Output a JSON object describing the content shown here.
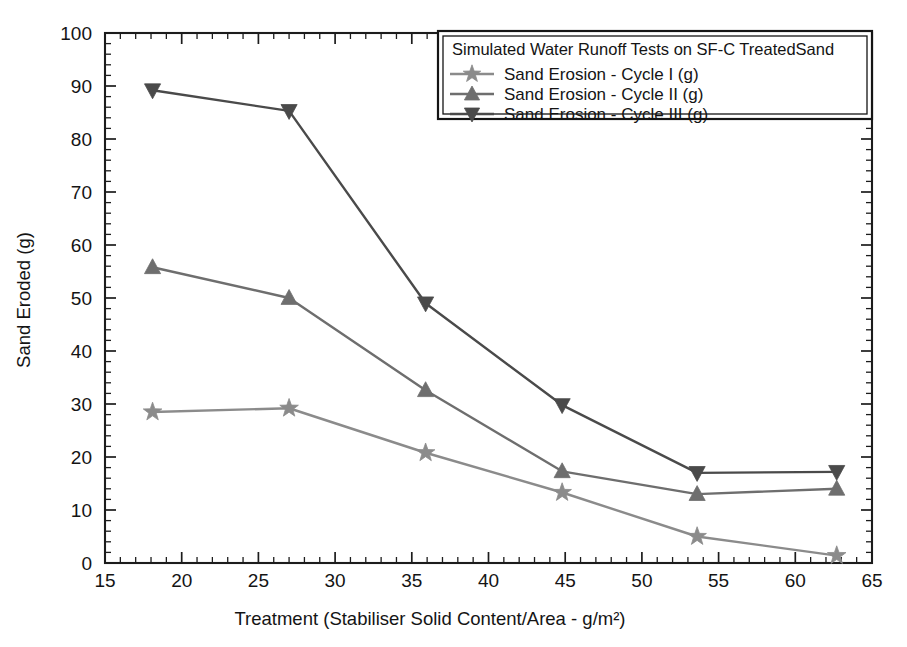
{
  "chart_data": {
    "type": "line",
    "title": "",
    "legend_title": "Simulated Water Runoff Tests on SF-C TreatedSand",
    "legend_position": "top-right",
    "grid": false,
    "xlabel": "Treatment (Stabiliser Solid Content/Area - g/m²)",
    "ylabel": "Sand Eroded (g)",
    "xlim": [
      15,
      65
    ],
    "ylim": [
      0,
      100
    ],
    "x_major_ticks": [
      15,
      20,
      25,
      30,
      35,
      40,
      45,
      50,
      55,
      60,
      65
    ],
    "y_major_ticks": [
      0,
      10,
      20,
      30,
      40,
      50,
      60,
      70,
      80,
      90,
      100
    ],
    "x_minor_step": 1,
    "y_minor_step": 2,
    "x": [
      18.1,
      27.0,
      35.9,
      44.8,
      53.6,
      62.7
    ],
    "series": [
      {
        "name": "Sand Erosion - Cycle I (g)",
        "marker": "star",
        "color": "#8b8b8b",
        "values": [
          28.5,
          29.2,
          20.8,
          13.3,
          5.0,
          1.4
        ]
      },
      {
        "name": "Sand Erosion - Cycle II (g)",
        "marker": "triangle-up",
        "color": "#6e6e6e",
        "values": [
          55.8,
          50.0,
          32.6,
          17.3,
          13.0,
          14.0
        ]
      },
      {
        "name": "Sand Erosion - Cycle III (g)",
        "marker": "triangle-down",
        "color": "#4a4a4a",
        "values": [
          89.2,
          85.3,
          49.0,
          29.8,
          17.0,
          17.2
        ]
      }
    ]
  },
  "axes": {
    "x_tick_labels": [
      "15",
      "20",
      "25",
      "30",
      "35",
      "40",
      "45",
      "50",
      "55",
      "60",
      "65"
    ],
    "y_tick_labels": [
      "0",
      "10",
      "20",
      "30",
      "40",
      "50",
      "60",
      "70",
      "80",
      "90",
      "100"
    ]
  },
  "legend": {
    "title": "Simulated Water Runoff Tests on SF-C TreatedSand",
    "entries": [
      "Sand Erosion - Cycle I (g)",
      "Sand Erosion - Cycle II (g)",
      "Sand Erosion - Cycle III (g)"
    ]
  }
}
